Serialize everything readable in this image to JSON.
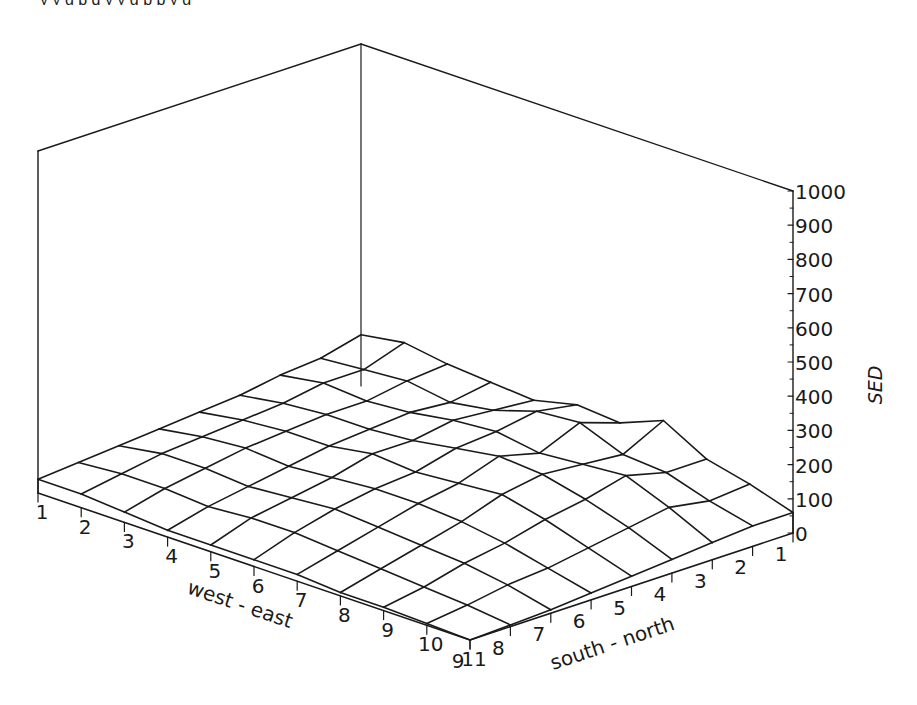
{
  "header": {
    "cutoff_text": "y y g p q y y g p p y g"
  },
  "chart_data": {
    "type": "surface3d",
    "title": "",
    "xlabel": "west - east",
    "ylabel": "south - north",
    "zlabel": "SED",
    "x_ticks": [
      "1",
      "2",
      "3",
      "4",
      "5",
      "6",
      "7",
      "8",
      "9",
      "10",
      "11"
    ],
    "y_ticks": [
      "1",
      "2",
      "3",
      "4",
      "5",
      "6",
      "7",
      "8",
      "9"
    ],
    "z_ticks": [
      "0",
      "100",
      "200",
      "300",
      "400",
      "500",
      "600",
      "700",
      "800",
      "900",
      "1000"
    ],
    "zlim": [
      0,
      1000
    ],
    "grid": false,
    "note": "rows indexed by south-north (1..9), columns by west-east (1..11); values in SED units, estimated from the wireframe",
    "z": [
      [
        150,
        170,
        150,
        140,
        130,
        160,
        150,
        200,
        130,
        100,
        60
      ],
      [
        120,
        130,
        140,
        120,
        140,
        180,
        190,
        140,
        130,
        90,
        60
      ],
      [
        110,
        130,
        120,
        130,
        150,
        160,
        140,
        150,
        160,
        110,
        50
      ],
      [
        90,
        110,
        120,
        120,
        130,
        150,
        170,
        160,
        130,
        90,
        40
      ],
      [
        80,
        100,
        110,
        110,
        130,
        120,
        130,
        140,
        110,
        70,
        30
      ],
      [
        70,
        90,
        100,
        90,
        100,
        110,
        110,
        100,
        80,
        50,
        20
      ],
      [
        60,
        80,
        80,
        70,
        80,
        90,
        80,
        70,
        60,
        40,
        10
      ],
      [
        50,
        60,
        60,
        50,
        60,
        60,
        50,
        40,
        30,
        20,
        5
      ],
      [
        40,
        40,
        30,
        20,
        20,
        20,
        20,
        10,
        10,
        5,
        0
      ]
    ]
  }
}
